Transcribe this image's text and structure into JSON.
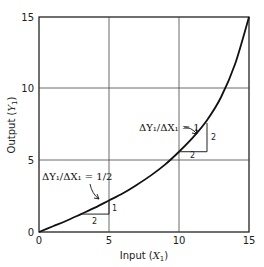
{
  "chart_data": {
    "type": "line",
    "title": "",
    "xlabel": "Input (X1)",
    "ylabel": "Output (Y1)",
    "xlim": [
      0,
      15
    ],
    "ylim": [
      0,
      15
    ],
    "grid": true,
    "x_ticks": [
      "0",
      "5",
      "10",
      "15"
    ],
    "y_ticks": [
      "0",
      "5",
      "10",
      "15"
    ],
    "series": [
      {
        "name": "Production curve",
        "x": [
          0,
          1,
          2,
          3,
          4,
          5,
          6,
          7,
          8,
          9,
          10,
          11,
          12,
          13,
          14,
          15
        ],
        "y": [
          0,
          0.4,
          0.8,
          1.25,
          1.7,
          2.2,
          2.7,
          3.3,
          3.95,
          4.7,
          5.6,
          6.6,
          7.8,
          9.4,
          11.7,
          15
        ]
      }
    ],
    "annotations": [
      {
        "label": "ΔY1/ΔX1 = 1/2",
        "triangle": {
          "x0": 3,
          "y0": 1.25,
          "run": 2,
          "rise": 1
        },
        "run_label": "2",
        "rise_label": "1"
      },
      {
        "label": "ΔY1/ΔX1 = 1",
        "triangle": {
          "x0": 10,
          "y0": 5.6,
          "run": 2,
          "rise": 2
        },
        "run_label": "2",
        "rise_label": "2"
      }
    ]
  },
  "labels": {
    "xlabel_main": "Input (",
    "xlabel_var": "X",
    "xlabel_sub": "1",
    "xlabel_close": ")",
    "ylabel_main": "Output (",
    "ylabel_var": "Y",
    "ylabel_sub": "1",
    "ylabel_close": ")",
    "ann1": "ΔY₁/ΔX₁ = 1/2",
    "ann2": "ΔY₁/ΔX₁ = 1",
    "tri1_run": "2",
    "tri1_rise": "1",
    "tri2_run": "2",
    "tri2_rise": "2",
    "xt0": "0",
    "xt5": "5",
    "xt10": "10",
    "xt15": "15",
    "yt0": "0",
    "yt5": "5",
    "yt10": "10",
    "yt15": "15"
  }
}
